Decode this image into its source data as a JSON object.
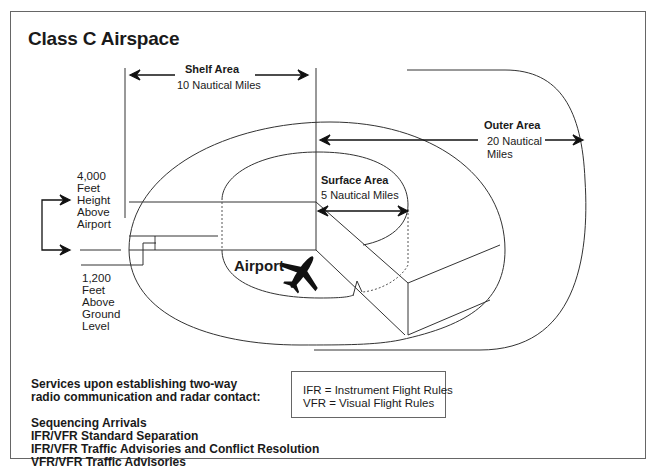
{
  "title": "Class C Airspace",
  "shelf": {
    "label": "Shelf Area",
    "distance": "10 Nautical Miles"
  },
  "outer": {
    "label": "Outer Area",
    "distance_line1": "20  Nautical",
    "distance_line2": "Miles"
  },
  "surface": {
    "label": "Surface Area",
    "distance": "5 Nautical Miles"
  },
  "ceiling": {
    "lines": [
      "4,000",
      "Feet",
      "Height",
      "Above",
      "Airport"
    ]
  },
  "floor": {
    "lines": [
      "1,200",
      "Feet",
      "Above",
      "Ground",
      "Level"
    ]
  },
  "airport_label": "Airport",
  "services": {
    "heading_line1": "Services upon establishing two-way",
    "heading_line2": "radio communication and radar contact:",
    "items": [
      "Sequencing Arrivals",
      "IFR/VFR Standard Separation",
      "IFR/VFR Traffic Advisories and Conflict Resolution",
      "VFR/VFR Traffic Advisories"
    ]
  },
  "legend": {
    "ifr": "IFR = Instrument Flight Rules",
    "vfr": "VFR = Visual Flight Rules"
  },
  "icons": {
    "airplane": "airplane-icon"
  },
  "colors": {
    "line": "#333333",
    "text": "#1a1a1a",
    "background": "#ffffff"
  }
}
